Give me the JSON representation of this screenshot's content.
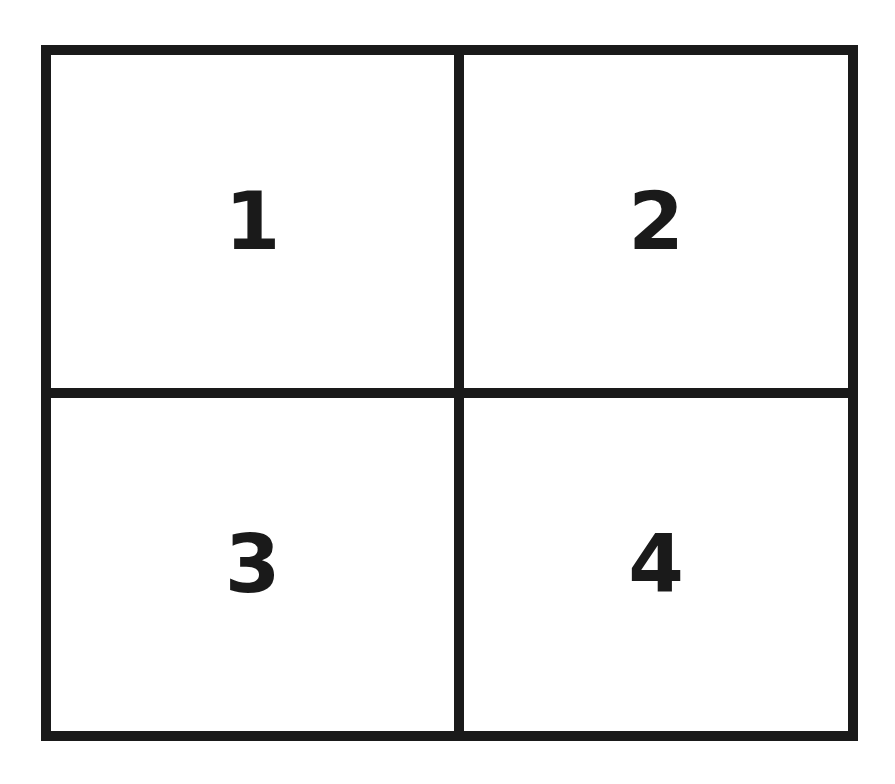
{
  "diagram": {
    "type": "2x2 grid",
    "border_color": "#1a1a1a",
    "background_color": "#ffffff",
    "cells": [
      {
        "position": "top-left",
        "label": "1"
      },
      {
        "position": "top-right",
        "label": "2"
      },
      {
        "position": "bottom-left",
        "label": "3"
      },
      {
        "position": "bottom-right",
        "label": "4"
      }
    ]
  }
}
